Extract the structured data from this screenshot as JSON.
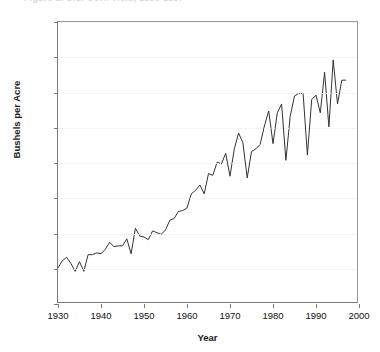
{
  "title_sliver": "Figure 1.  U.S. Corn Yield, 1930-1997",
  "chart_data": {
    "type": "line",
    "title": "",
    "xlabel": "Year",
    "ylabel": "Bushels per Acre",
    "xlim": [
      1930,
      2000
    ],
    "ylim": [
      0,
      160
    ],
    "xticks": [
      1930,
      1940,
      1950,
      1960,
      1970,
      1980,
      1990,
      2000
    ],
    "yticks": [
      0,
      20,
      40,
      60,
      80,
      100,
      120,
      140,
      160
    ],
    "grid": true,
    "legend": "none",
    "line_color": "#333333",
    "series": [
      {
        "name": "Bushels per Acre",
        "x": [
          1930,
          1931,
          1932,
          1933,
          1934,
          1935,
          1936,
          1937,
          1938,
          1939,
          1940,
          1941,
          1942,
          1943,
          1944,
          1945,
          1946,
          1947,
          1948,
          1949,
          1950,
          1951,
          1952,
          1953,
          1954,
          1955,
          1956,
          1957,
          1958,
          1959,
          1960,
          1961,
          1962,
          1963,
          1964,
          1965,
          1966,
          1967,
          1968,
          1969,
          1970,
          1971,
          1972,
          1973,
          1974,
          1975,
          1976,
          1977,
          1978,
          1979,
          1980,
          1981,
          1982,
          1983,
          1984,
          1985,
          1986,
          1987,
          1988,
          1989,
          1990,
          1991,
          1992,
          1993,
          1994,
          1995,
          1996,
          1997
        ],
        "values": [
          20.5,
          24.5,
          26.5,
          23.0,
          18.5,
          24.0,
          18.5,
          28.0,
          28.0,
          29.0,
          28.5,
          31.0,
          35.0,
          32.5,
          33.0,
          33.0,
          37.0,
          28.5,
          43.0,
          38.5,
          38.0,
          36.5,
          41.5,
          40.5,
          39.5,
          42.0,
          47.5,
          48.5,
          52.5,
          53.0,
          54.5,
          62.5,
          64.5,
          67.5,
          62.5,
          74.0,
          73.0,
          80.5,
          79.5,
          85.5,
          72.5,
          88.0,
          97.0,
          91.5,
          71.5,
          86.5,
          88.0,
          90.5,
          101.0,
          109.5,
          91.0,
          108.5,
          113.5,
          81.5,
          106.5,
          118.0,
          119.5,
          119.5,
          84.5,
          116.0,
          118.5,
          108.5,
          131.5,
          100.5,
          138.5,
          113.5,
          127.0,
          127.0
        ]
      }
    ]
  },
  "axes": {
    "y_tick_labels": [
      "0",
      "20",
      "40",
      "60",
      "80",
      "100",
      "120",
      "140",
      "160"
    ],
    "x_tick_labels": [
      "1930",
      "1940",
      "1950",
      "1960",
      "1970",
      "1980",
      "1990",
      "2000"
    ]
  }
}
